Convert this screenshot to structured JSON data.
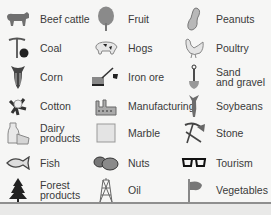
{
  "legend": {
    "columns": [
      {
        "items": [
          {
            "label": "Beef cattle",
            "icon": "cattle-icon"
          },
          {
            "label": "Coal",
            "icon": "coal-pick-icon"
          },
          {
            "label": "Corn",
            "icon": "corn-icon"
          },
          {
            "label": "Cotton",
            "icon": "cotton-icon"
          },
          {
            "label": "Dairy\nproducts",
            "icon": "dairy-icon"
          },
          {
            "label": "Fish",
            "icon": "fish-icon"
          },
          {
            "label": "Forest\nproducts",
            "icon": "tree-icon"
          }
        ]
      },
      {
        "items": [
          {
            "label": "Fruit",
            "icon": "fruit-tree-icon"
          },
          {
            "label": "Hogs",
            "icon": "hog-icon"
          },
          {
            "label": "Iron ore",
            "icon": "iron-ore-icon"
          },
          {
            "label": "Manufacturing",
            "icon": "factory-icon"
          },
          {
            "label": "Marble",
            "icon": "marble-icon"
          },
          {
            "label": "Nuts",
            "icon": "nuts-icon"
          },
          {
            "label": "Oil",
            "icon": "oil-derrick-icon"
          }
        ]
      },
      {
        "items": [
          {
            "label": "Peanuts",
            "icon": "peanut-icon"
          },
          {
            "label": "Poultry",
            "icon": "poultry-icon"
          },
          {
            "label": "Sand\nand gravel",
            "icon": "shovel-icon"
          },
          {
            "label": "Soybeans",
            "icon": "soybean-icon"
          },
          {
            "label": "Stone",
            "icon": "pick-shovel-icon"
          },
          {
            "label": "Tourism",
            "icon": "glasses-icon"
          },
          {
            "label": "Vegetables",
            "icon": "vegetables-icon"
          }
        ]
      }
    ]
  }
}
